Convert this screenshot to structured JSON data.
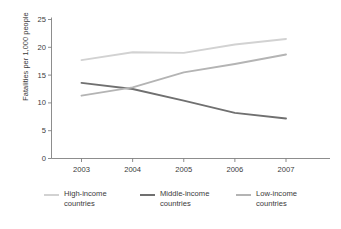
{
  "chart_data": {
    "type": "line",
    "title": "",
    "xlabel": "",
    "ylabel": "Fatalities per 1,000 people",
    "categories": [
      "2003",
      "2004",
      "2005",
      "2006",
      "2007"
    ],
    "x": [
      2003,
      2004,
      2005,
      2006,
      2007
    ],
    "ylim": [
      0,
      25
    ],
    "yticks": [
      "0",
      "5",
      "10",
      "15",
      "20",
      "25"
    ],
    "ytick_values": [
      0,
      5,
      10,
      15,
      20,
      25
    ],
    "grid": false,
    "legend_position": "bottom",
    "series": [
      {
        "name": "High-income countries",
        "label_line1": "High-income",
        "label_line2": "countries",
        "color": "#d2d2d2",
        "values": [
          17.7,
          19.1,
          19.0,
          20.5,
          21.5
        ]
      },
      {
        "name": "Middle-income countries",
        "label_line1": "Middle-income",
        "label_line2": "countries",
        "color": "#707070",
        "values": [
          13.6,
          12.5,
          10.4,
          8.2,
          7.2
        ]
      },
      {
        "name": "Low-income countries",
        "label_line1": "Low-income",
        "label_line2": "countries",
        "color": "#b4b4b4",
        "values": [
          11.3,
          12.8,
          15.5,
          17.0,
          18.7
        ]
      }
    ]
  },
  "axis": {
    "color": "#808080"
  }
}
